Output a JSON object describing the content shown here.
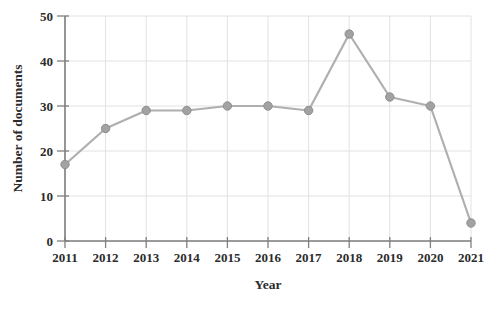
{
  "chart_data": {
    "type": "line",
    "title": "",
    "xlabel": "Year",
    "ylabel": "Number of documents",
    "x": [
      2011,
      2012,
      2013,
      2014,
      2015,
      2016,
      2017,
      2018,
      2019,
      2020,
      2021
    ],
    "values": [
      17,
      25,
      29,
      29,
      30,
      30,
      29,
      46,
      32,
      30,
      4
    ],
    "ylim": [
      0,
      50
    ],
    "yticks": [
      0,
      10,
      20,
      30,
      40,
      50
    ],
    "grid": true,
    "legend": "none",
    "colors": {
      "line": "#afafaf",
      "marker_fill": "#a2a2a2",
      "marker_stroke": "#8e8e8e",
      "gridline": "#e2e2e2",
      "axis": "#7f7f7f",
      "text": "#2b2b2b",
      "background": "#ffffff"
    }
  }
}
